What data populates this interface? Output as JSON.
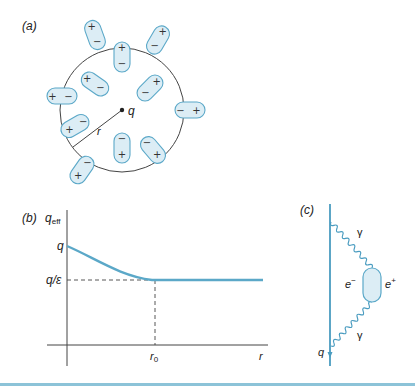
{
  "panels": {
    "a": {
      "label": "(a)",
      "charge_label": "q",
      "radius_label": "r",
      "dipoles": [
        {
          "cx": 95,
          "cy": 35,
          "angle": -20,
          "top": "+",
          "bottom": "−"
        },
        {
          "cx": 122,
          "cy": 57,
          "angle": 0,
          "top": "+",
          "bottom": "−"
        },
        {
          "cx": 158,
          "cy": 40,
          "angle": 30,
          "top": "+",
          "bottom": "−"
        },
        {
          "cx": 95,
          "cy": 84,
          "angle": -55,
          "top": "+",
          "bottom": "−"
        },
        {
          "cx": 150,
          "cy": 88,
          "angle": 45,
          "top": "+",
          "bottom": "−"
        },
        {
          "cx": 62,
          "cy": 96,
          "angle": -90,
          "top": "+",
          "bottom": "−"
        },
        {
          "cx": 190,
          "cy": 110,
          "angle": -90,
          "top": "−",
          "bottom": "+"
        },
        {
          "cx": 75,
          "cy": 126,
          "angle": 60,
          "top": "−",
          "bottom": "+"
        },
        {
          "cx": 122,
          "cy": 148,
          "angle": 0,
          "top": "−",
          "bottom": "+"
        },
        {
          "cx": 153,
          "cy": 150,
          "angle": -40,
          "top": "−",
          "bottom": "+"
        },
        {
          "cx": 82,
          "cy": 170,
          "angle": 35,
          "top": "−",
          "bottom": "+"
        }
      ]
    },
    "b": {
      "label": "(b)",
      "y_axis_label": "q",
      "y_axis_sub": "eff",
      "x_axis_label": "r",
      "tick_q": "q",
      "tick_q_eps": "q/ε",
      "tick_r0": "r",
      "tick_r0_sub": "0"
    },
    "c": {
      "label": "(c)",
      "photon_top": "γ",
      "photon_bottom": "γ",
      "electron": "e",
      "electron_sup": "−",
      "positron": "e",
      "positron_sup": "+",
      "charge": "q"
    }
  },
  "colors": {
    "accent": "#5ba8c8",
    "fill": "#dcedf5",
    "line": "#444444",
    "rule": "#8cc3d8"
  }
}
